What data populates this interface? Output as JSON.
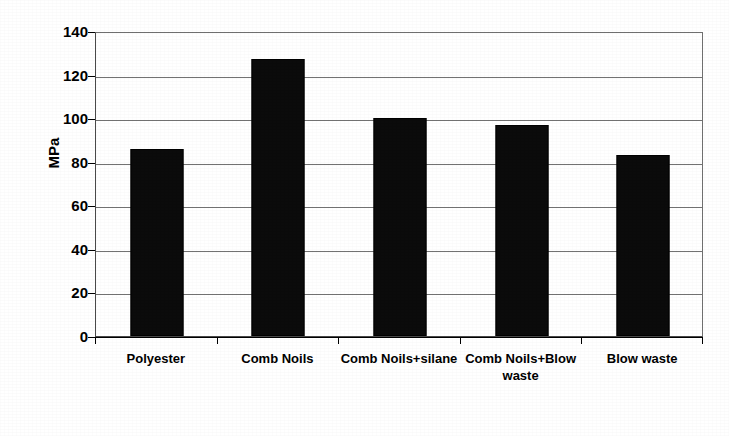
{
  "chart_data": {
    "type": "bar",
    "title": "",
    "subtitle": "",
    "xlabel": "",
    "ylabel": "MPa",
    "categories": [
      "Polyester",
      "Comb Noils",
      "Comb Noils+silane",
      "Comb Noils+Blow waste",
      "Blow waste"
    ],
    "values": [
      86,
      127,
      100,
      97,
      83
    ],
    "ylim": [
      0,
      140
    ],
    "ytick_step": 20,
    "ytick_labels": [
      "0",
      "20",
      "40",
      "60",
      "80",
      "100",
      "120",
      "140"
    ],
    "grid": "horizontal",
    "legend": "none",
    "bar_color": "#0b0b0b",
    "gridline_color": "#737373",
    "axis_color": "#000000",
    "background_color": "#ffffff"
  },
  "axis": {
    "y_title": "MPa"
  }
}
